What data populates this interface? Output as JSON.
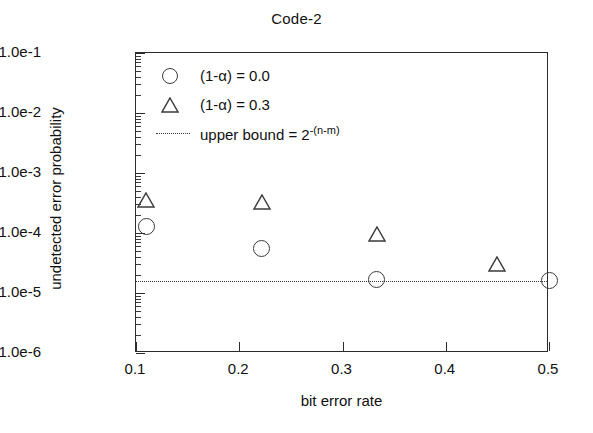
{
  "chart_data": {
    "type": "scatter",
    "title": "Code-2",
    "xlabel": "bit error rate",
    "ylabel": "undetected error probability",
    "xlim": [
      0.1,
      0.5
    ],
    "ylim": [
      1e-06,
      0.1
    ],
    "yscale": "log",
    "xscale": "linear",
    "grid": false,
    "legend_position": "top-left inside axes",
    "xticks": [
      "0.1",
      "0.2",
      "0.3",
      "0.4",
      "0.5"
    ],
    "xtick_values": [
      0.1,
      0.2,
      0.3,
      0.4,
      0.5
    ],
    "yticks": [
      "1.0e-1",
      "1.0e-2",
      "1.0e-3",
      "1.0e-4",
      "1.0e-5",
      "1.0e-6"
    ],
    "ytick_values": [
      0.1,
      0.01,
      0.001,
      0.0001,
      1e-05,
      1e-06
    ],
    "series": [
      {
        "name": "(1-α) = 0.0",
        "marker": "circle",
        "x": [
          0.11,
          0.222,
          0.333,
          0.5
        ],
        "y": [
          0.00013,
          5.5e-05,
          1.7e-05,
          1.6e-05
        ]
      },
      {
        "name": "(1-α) = 0.3",
        "marker": "triangle",
        "x": [
          0.11,
          0.222,
          0.333,
          0.45
        ],
        "y": [
          0.00035,
          0.00033,
          9.5e-05,
          3e-05
        ]
      }
    ],
    "reference_lines": [
      {
        "name": "upper bound = 2^-(n-m)",
        "label_main": "upper bound = 2",
        "label_sup": "-(n-m)",
        "style": "dotted",
        "orientation": "horizontal",
        "y": 1.6e-05
      }
    ],
    "legend_entries": [
      {
        "marker": "circle",
        "label": "(1-α) = 0.0"
      },
      {
        "marker": "triangle",
        "label": "(1-α) = 0.3"
      },
      {
        "marker": "dotted-line",
        "label_main": "upper bound = 2",
        "label_sup": "-(n-m)"
      }
    ],
    "colors": {
      "marker_stroke": "#3b3b3b",
      "axis": "#2b2b2b",
      "text": "#111111",
      "background": "#ffffff"
    }
  }
}
